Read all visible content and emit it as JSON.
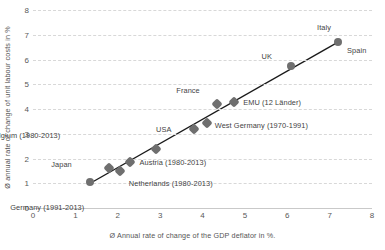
{
  "chart_data": {
    "type": "scatter",
    "title": "",
    "xlabel": "Ø Annual rate of change of the GDP deflator in %.",
    "ylabel": "Ø annual rate of change of unit labour costs in %",
    "xlim": [
      0,
      8
    ],
    "ylim": [
      0,
      8
    ],
    "xticks": [
      "0",
      "1",
      "2",
      "3",
      "4",
      "5",
      "6",
      "7",
      "8"
    ],
    "yticks": [
      "0",
      "1",
      "2",
      "3",
      "4",
      "5",
      "6",
      "7",
      "8"
    ],
    "grid": "horizontal",
    "legend": "none",
    "marker_color": "#6f6f6f",
    "trendline_color": "#1a1a1a",
    "gridline_color": "#d8d8d8",
    "points": [
      {
        "label": "Germany (1991-2013)",
        "x": 1.35,
        "y": 1.05,
        "label_dx": -6,
        "label_dy": 26,
        "shape": "round"
      },
      {
        "label": "Japan",
        "x": 1.8,
        "y": 1.6,
        "label_dx": -37,
        "label_dy": -3,
        "shape": "diamond"
      },
      {
        "label": "Netherlands (1980-2013)",
        "x": 2.05,
        "y": 1.5,
        "label_dx": 9,
        "label_dy": 13,
        "shape": "diamond"
      },
      {
        "label": "Austria (1980-2013)",
        "x": 2.3,
        "y": 1.85,
        "label_dx": 9,
        "label_dy": 1,
        "shape": "diamond"
      },
      {
        "label": "Belgium (1980-2013)",
        "x": 2.9,
        "y": 2.4,
        "label_dx": -96,
        "label_dy": -13,
        "shape": "diamond"
      },
      {
        "label": "USA",
        "x": 3.8,
        "y": 3.2,
        "label_dx": -23,
        "label_dy": 1,
        "shape": "diamond"
      },
      {
        "label": "West Germany (1970-1991)",
        "x": 4.1,
        "y": 3.45,
        "label_dx": 8,
        "label_dy": 3,
        "shape": "diamond"
      },
      {
        "label": "France",
        "x": 4.35,
        "y": 4.2,
        "label_dx": -18,
        "label_dy": -13,
        "shape": "diamond"
      },
      {
        "label": "EMU (12 Länder)",
        "x": 4.75,
        "y": 4.3,
        "label_dx": 9,
        "label_dy": 1,
        "shape": "diamond"
      },
      {
        "label": "UK",
        "x": 6.1,
        "y": 5.75,
        "label_dx": -20,
        "label_dy": -9,
        "shape": "round"
      },
      {
        "label": "Italy",
        "x": 7.2,
        "y": 6.7,
        "label_dx": -7,
        "label_dy": -14,
        "shape": "round"
      },
      {
        "label": "Spain",
        "x": 7.2,
        "y": 6.7,
        "label_dx": 9,
        "label_dy": 9,
        "shape": "none"
      }
    ],
    "trendline": {
      "x1": 1.3,
      "y1": 0.95,
      "x2": 7.25,
      "y2": 6.75
    }
  }
}
